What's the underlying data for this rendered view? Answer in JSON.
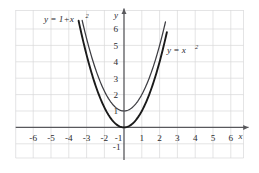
{
  "chart_data": {
    "type": "line",
    "title": "",
    "subtitle": "",
    "xlabel": "x",
    "ylabel": "y",
    "xlim": [
      -6.9,
      6.9
    ],
    "ylim": [
      -2,
      6.9
    ],
    "grid": true,
    "legend": "inline-annotations",
    "x_ticks": [
      "-6",
      "-5",
      "-4",
      "-3",
      "-2",
      "-1",
      "1",
      "2",
      "3",
      "4",
      "5",
      "6"
    ],
    "x_tick_values": [
      -6,
      -5,
      -4,
      -3,
      -2,
      -1,
      1,
      2,
      3,
      4,
      5,
      6
    ],
    "y_ticks": [
      "6",
      "5",
      "4",
      "3",
      "2",
      "1",
      "-1"
    ],
    "y_tick_values": [
      6,
      5,
      4,
      3,
      2,
      1,
      -1
    ],
    "series": [
      {
        "name": "y = 1 + x²",
        "label_base": "y = 1+x",
        "label_exp": "2",
        "formula": "1+x^2",
        "vertex": [
          0,
          1
        ],
        "x_range": [
          -2.35,
          2.35
        ],
        "style": "thin",
        "color": "#3d3d42",
        "label_position": "upper-left",
        "points_x": [
          -2.35,
          -2.0,
          -1.5,
          -1.0,
          -0.5,
          0,
          0.5,
          1.0,
          1.5,
          2.0,
          2.35
        ],
        "points_y": [
          6.52,
          5.0,
          3.25,
          2.0,
          1.25,
          1.0,
          1.25,
          2.0,
          3.25,
          5.0,
          6.52
        ]
      },
      {
        "name": "y = x²",
        "label_base": "y = x",
        "label_exp": "2",
        "formula": "x^2",
        "vertex": [
          0,
          0
        ],
        "x_range": [
          -2.55,
          2.42
        ],
        "style": "thick",
        "color": "#1a1a1a",
        "label_position": "right",
        "points_x": [
          -2.55,
          -2.0,
          -1.5,
          -1.0,
          -0.5,
          0,
          0.5,
          1.0,
          1.5,
          2.0,
          2.42
        ],
        "points_y": [
          6.5,
          4.0,
          2.25,
          1.0,
          0.25,
          0.0,
          0.25,
          1.0,
          2.25,
          4.0,
          5.86
        ]
      }
    ],
    "colors": {
      "grid": "#d8d8da",
      "axis": "#58585c",
      "curve_thick": "#1a1a1a",
      "curve_thin": "#3d3d42",
      "background": "#ffffff",
      "text": "#2b2b2e"
    }
  }
}
